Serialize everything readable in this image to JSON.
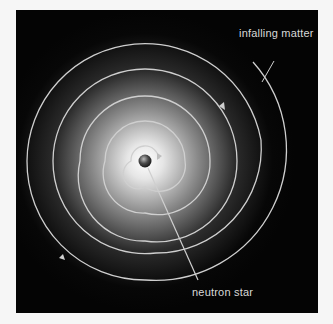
{
  "diagram": {
    "type": "accretion-spiral",
    "labels": {
      "infalling_matter": "infalling matter",
      "neutron_star": "neutron star"
    },
    "colors": {
      "background": "#040404",
      "page": "#f6f6f6",
      "spiral": "#d0d0d0",
      "glow_center": "#ffffff",
      "star": "#333333"
    }
  }
}
